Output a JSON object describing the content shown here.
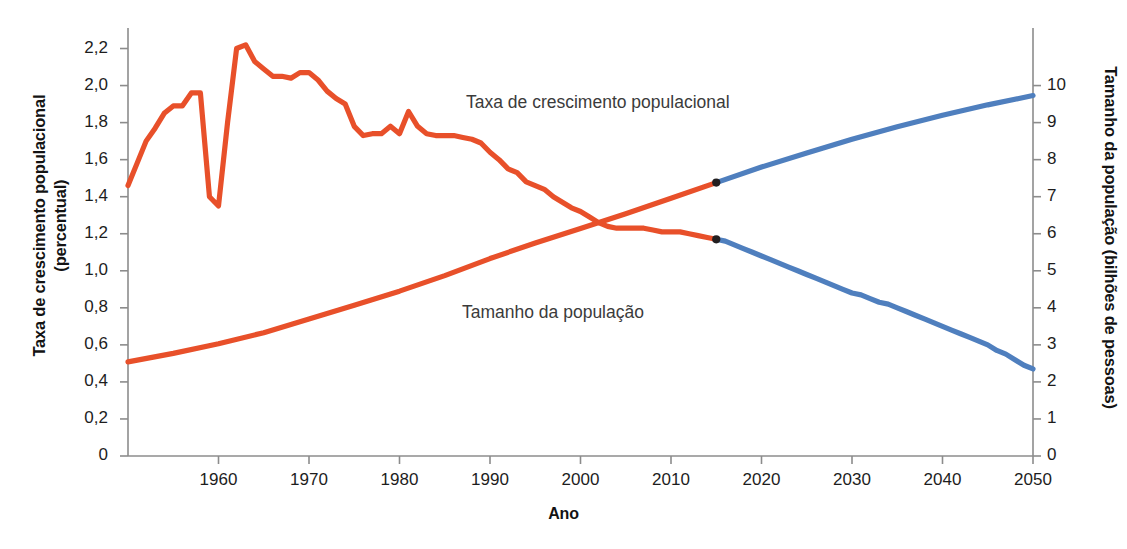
{
  "chart_data": {
    "type": "line",
    "title": "",
    "subtitle": "",
    "xlabel": "Ano",
    "ylabel": "Taxa de crescimento populacional (percentual)",
    "y2label": "Tamanho da população (bilhões de pessoas)",
    "grid": false,
    "legend_position": "inline-annotations",
    "xlim": [
      1950,
      2050
    ],
    "ylim": [
      0,
      2.3
    ],
    "y2lim": [
      0,
      11.5
    ],
    "x_ticks": [
      1960,
      1970,
      1980,
      1990,
      2000,
      2010,
      2020,
      2030,
      2040,
      2050
    ],
    "x_tick_labels": [
      "1960",
      "1970",
      "1980",
      "1990",
      "2000",
      "2010",
      "2020",
      "2030",
      "2040",
      "2050"
    ],
    "y_ticks": [
      0,
      0.2,
      0.4,
      0.6,
      0.8,
      1.0,
      1.2,
      1.4,
      1.6,
      1.8,
      2.0,
      2.2
    ],
    "y_tick_labels": [
      "0",
      "0,2",
      "0,4",
      "0,6",
      "0,8",
      "1,0",
      "1,2",
      "1,4",
      "1,6",
      "1,8",
      "2,0",
      "2,2"
    ],
    "y2_ticks": [
      0,
      1,
      2,
      3,
      4,
      5,
      6,
      7,
      8,
      9,
      10
    ],
    "y2_tick_labels": [
      "0",
      "1",
      "2",
      "3",
      "4",
      "5",
      "6",
      "7",
      "8",
      "9",
      "10"
    ],
    "colors": {
      "historical": "#e8502a",
      "projection": "#4f7fbe",
      "marker": "#231f20",
      "axis": "#8c8c8c",
      "text": "#1d1d1d"
    },
    "annotations": [
      {
        "name": "growth-rate-label",
        "text": "Taxa de crescimento populacional",
        "x": 1992,
        "y": 1.98
      },
      {
        "name": "population-size-label",
        "text": "Tamanho da população",
        "x": 1992,
        "y": 0.84
      }
    ],
    "split_year": 2015,
    "series": [
      {
        "name": "Taxa de crescimento populacional",
        "axis": "left",
        "unit": "percentual",
        "historical_color": "#e8502a",
        "projection_color": "#4f7fbe",
        "x": [
          1950,
          1951,
          1952,
          1953,
          1954,
          1955,
          1956,
          1957,
          1958,
          1959,
          1960,
          1961,
          1962,
          1963,
          1964,
          1965,
          1966,
          1967,
          1968,
          1969,
          1970,
          1971,
          1972,
          1973,
          1974,
          1975,
          1976,
          1977,
          1978,
          1979,
          1980,
          1981,
          1982,
          1983,
          1984,
          1985,
          1986,
          1987,
          1988,
          1989,
          1990,
          1991,
          1992,
          1993,
          1994,
          1995,
          1996,
          1997,
          1998,
          1999,
          2000,
          2001,
          2002,
          2003,
          2004,
          2005,
          2006,
          2007,
          2008,
          2009,
          2010,
          2011,
          2012,
          2013,
          2014,
          2015,
          2016,
          2017,
          2018,
          2019,
          2020,
          2021,
          2022,
          2023,
          2024,
          2025,
          2026,
          2027,
          2028,
          2029,
          2030,
          2031,
          2032,
          2033,
          2034,
          2035,
          2036,
          2037,
          2038,
          2039,
          2040,
          2041,
          2042,
          2043,
          2044,
          2045,
          2046,
          2047,
          2048,
          2049,
          2050
        ],
        "y": [
          1.46,
          1.58,
          1.7,
          1.77,
          1.85,
          1.89,
          1.89,
          1.96,
          1.96,
          1.4,
          1.35,
          1.8,
          2.2,
          2.22,
          2.13,
          2.09,
          2.05,
          2.05,
          2.04,
          2.07,
          2.07,
          2.03,
          1.97,
          1.93,
          1.9,
          1.78,
          1.73,
          1.74,
          1.74,
          1.78,
          1.74,
          1.86,
          1.78,
          1.74,
          1.73,
          1.73,
          1.73,
          1.72,
          1.71,
          1.69,
          1.64,
          1.6,
          1.55,
          1.53,
          1.48,
          1.46,
          1.44,
          1.4,
          1.37,
          1.34,
          1.32,
          1.29,
          1.26,
          1.24,
          1.23,
          1.23,
          1.23,
          1.23,
          1.22,
          1.21,
          1.21,
          1.21,
          1.2,
          1.19,
          1.18,
          1.17,
          1.16,
          1.14,
          1.12,
          1.1,
          1.08,
          1.06,
          1.04,
          1.02,
          1.0,
          0.98,
          0.96,
          0.94,
          0.92,
          0.9,
          0.88,
          0.87,
          0.85,
          0.83,
          0.82,
          0.8,
          0.78,
          0.76,
          0.74,
          0.72,
          0.7,
          0.68,
          0.66,
          0.64,
          0.62,
          0.6,
          0.57,
          0.55,
          0.52,
          0.49,
          0.47
        ]
      },
      {
        "name": "Tamanho da população",
        "axis": "right",
        "unit": "bilhões de pessoas",
        "historical_color": "#e8502a",
        "projection_color": "#4f7fbe",
        "x": [
          1950,
          1955,
          1960,
          1965,
          1970,
          1975,
          1980,
          1985,
          1990,
          1995,
          2000,
          2005,
          2010,
          2015,
          2020,
          2025,
          2030,
          2035,
          2040,
          2045,
          2050
        ],
        "y": [
          2.54,
          2.77,
          3.03,
          3.33,
          3.7,
          4.07,
          4.45,
          4.87,
          5.33,
          5.75,
          6.14,
          6.54,
          6.96,
          7.38,
          7.8,
          8.18,
          8.55,
          8.89,
          9.2,
          9.48,
          9.73
        ]
      }
    ]
  },
  "axis_titles": {
    "left_line1": "Taxa de crescimento populacional",
    "left_line2": "(percentual)",
    "right": "Tamanho da população (bilhões de pessoas)",
    "bottom": "Ano"
  }
}
